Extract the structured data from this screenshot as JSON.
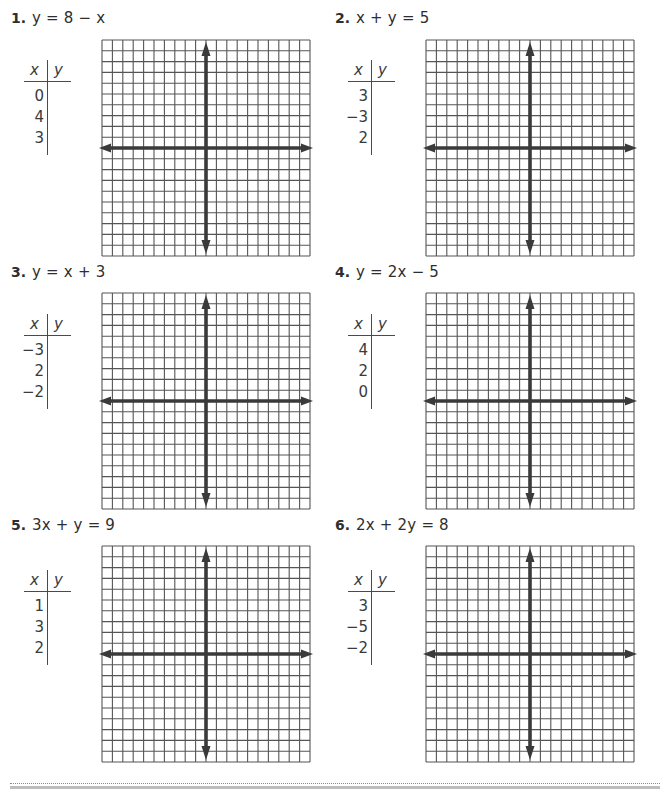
{
  "worksheet": {
    "problems": [
      {
        "number": "1.",
        "equation": "y = 8 − x",
        "table": {
          "x_header": "x",
          "y_header": "y",
          "x_values": [
            "0",
            "4",
            "3"
          ],
          "y_values": [
            "",
            "",
            ""
          ]
        },
        "grid": {
          "columns": 20,
          "rows": 20,
          "axis_column": 10,
          "axis_row": 10
        }
      },
      {
        "number": "2.",
        "equation": "x + y = 5",
        "table": {
          "x_header": "x",
          "y_header": "y",
          "x_values": [
            "3",
            "−3",
            "2"
          ],
          "y_values": [
            "",
            "",
            ""
          ]
        },
        "grid": {
          "columns": 20,
          "rows": 20,
          "axis_column": 10,
          "axis_row": 10
        }
      },
      {
        "number": "3.",
        "equation": "y = x + 3",
        "table": {
          "x_header": "x",
          "y_header": "y",
          "x_values": [
            "−3",
            "2",
            "−2"
          ],
          "y_values": [
            "",
            "",
            ""
          ]
        },
        "grid": {
          "columns": 20,
          "rows": 20,
          "axis_column": 10,
          "axis_row": 10
        }
      },
      {
        "number": "4.",
        "equation": "y = 2x − 5",
        "table": {
          "x_header": "x",
          "y_header": "y",
          "x_values": [
            "4",
            "2",
            "0"
          ],
          "y_values": [
            "",
            "",
            ""
          ]
        },
        "grid": {
          "columns": 20,
          "rows": 20,
          "axis_column": 10,
          "axis_row": 10
        }
      },
      {
        "number": "5.",
        "equation": "3x + y = 9",
        "table": {
          "x_header": "x",
          "y_header": "y",
          "x_values": [
            "1",
            "3",
            "2"
          ],
          "y_values": [
            "",
            "",
            ""
          ]
        },
        "grid": {
          "columns": 20,
          "rows": 20,
          "axis_column": 10,
          "axis_row": 10
        }
      },
      {
        "number": "6.",
        "equation": "2x + 2y = 8",
        "table": {
          "x_header": "x",
          "y_header": "y",
          "x_values": [
            "3",
            "−5",
            "−2"
          ],
          "y_values": [
            "",
            "",
            ""
          ]
        },
        "grid": {
          "columns": 20,
          "rows": 20,
          "axis_column": 10,
          "axis_row": 10
        }
      }
    ]
  },
  "colors": {
    "grid_line": "#555555",
    "axis": "#3a3a3a",
    "text": "#2e2e2e"
  }
}
